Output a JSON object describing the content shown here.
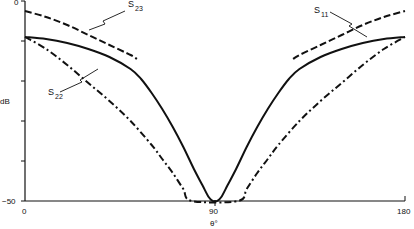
{
  "chart_data": {
    "type": "line",
    "title": "",
    "xlabel": "θ°",
    "ylabel": "dB",
    "xlim": [
      0,
      180
    ],
    "ylim": [
      -50,
      0
    ],
    "x_ticks": [
      {
        "value": 0,
        "label": "0"
      },
      {
        "value": 90,
        "label": "90"
      },
      {
        "value": 180,
        "label": "180"
      }
    ],
    "y_ticks": [
      {
        "value": 0,
        "label": "0"
      },
      {
        "value": -10,
        "label": ""
      },
      {
        "value": -20,
        "label": ""
      },
      {
        "value": -30,
        "label": ""
      },
      {
        "value": -40,
        "label": ""
      },
      {
        "value": -50,
        "label": "-50"
      }
    ],
    "grid": false,
    "legend": "inline annotations",
    "series": [
      {
        "name": "S11",
        "style": "solid",
        "x": [
          0,
          10,
          20,
          30,
          40,
          50,
          55,
          60,
          65,
          70,
          75,
          80,
          84,
          87,
          89,
          90,
          91,
          93,
          96,
          100,
          105,
          110,
          115,
          120,
          125,
          130,
          140,
          150,
          160,
          170,
          180
        ],
        "y": [
          -9,
          -9.5,
          -10.5,
          -12,
          -14,
          -17,
          -19.5,
          -23,
          -27,
          -31.5,
          -36.5,
          -42,
          -46,
          -49,
          -50,
          -50,
          -50,
          -49,
          -46,
          -42,
          -36.5,
          -31.5,
          -27,
          -23,
          -19.5,
          -17,
          -14,
          -12,
          -10.5,
          -9.5,
          -9
        ]
      },
      {
        "name": "S23",
        "style": "dashed",
        "x": [
          0,
          10,
          20,
          30,
          40,
          50,
          53,
          127,
          130,
          140,
          150,
          160,
          170,
          180
        ],
        "y": [
          -2.5,
          -4,
          -6,
          -8.5,
          -11,
          -13.5,
          -14.5,
          -14.5,
          -13.5,
          -11,
          -8.5,
          -6,
          -4,
          -2.5
        ]
      },
      {
        "name": "S22",
        "style": "dash-dot",
        "x": [
          0,
          10,
          20,
          30,
          40,
          50,
          60,
          65,
          70,
          75,
          79,
          101,
          105,
          110,
          115,
          120,
          130,
          140,
          150,
          160,
          170,
          180
        ],
        "y": [
          -9,
          -12,
          -16,
          -20.5,
          -25,
          -30,
          -36,
          -39.5,
          -43,
          -47,
          -50,
          -50,
          -47,
          -43,
          -39.5,
          -36,
          -30,
          -25,
          -20.5,
          -16,
          -12,
          -9
        ]
      }
    ],
    "annotations": [
      {
        "text": "S",
        "sub": "23",
        "target": "dashed curve"
      },
      {
        "text": "S",
        "sub": "11",
        "target": "solid curve"
      },
      {
        "text": "S",
        "sub": "22",
        "target": "dash-dot curve"
      }
    ]
  },
  "labels": {
    "y_axis": "dB",
    "x_axis": "θ°",
    "y_top": "0",
    "y_bottom": "−50",
    "x_left": "0",
    "x_mid": "90",
    "x_right": "180",
    "s23_main": "S",
    "s23_sub": "23",
    "s11_main": "S",
    "s11_sub": "11",
    "s22_main": "S",
    "s22_sub": "22"
  }
}
